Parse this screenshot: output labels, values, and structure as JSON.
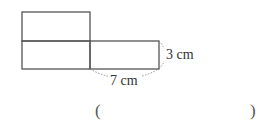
{
  "figure": {
    "rectangle_length": "7 cm",
    "rectangle_width": "3 cm",
    "labels": {
      "width": "3 cm",
      "length": "7 cm"
    },
    "stroke_color": "#555555"
  },
  "answer": {
    "open_paren": "(",
    "close_paren": ")",
    "value": ""
  }
}
